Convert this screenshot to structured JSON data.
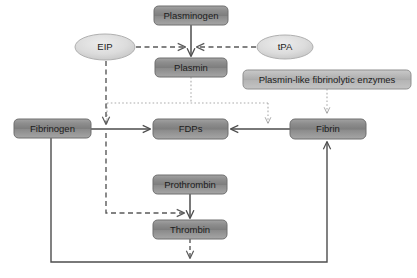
{
  "diagram": {
    "canvas": {
      "width": 417,
      "height": 278,
      "background": "#ffffff"
    },
    "colors": {
      "box_fill_dark": "#8c8c8c",
      "box_fill_light": "#b5b5b5",
      "box_stroke": "#6e6e6e",
      "ellipse_fill": "#d9d9d9",
      "ellipse_stroke": "#9a9a9a",
      "connector_solid": "#4d4d4d",
      "connector_dashed": "#5a5a5a",
      "connector_dotted": "#a8a8a8",
      "text": "#1c1c1c"
    },
    "nodes": [
      {
        "id": "plasminogen",
        "label": "Plasminogen",
        "shape": "rounded-rect",
        "x": 154,
        "y": 6,
        "w": 74,
        "h": 19,
        "fill": "dark",
        "font_size": 9.5
      },
      {
        "id": "eip",
        "label": "EIP",
        "shape": "ellipse",
        "cx": 105,
        "cy": 47,
        "rx": 30,
        "ry": 13,
        "fill": "ellipse",
        "font_size": 9.5
      },
      {
        "id": "tpa",
        "label": "tPA",
        "shape": "ellipse",
        "cx": 285,
        "cy": 47,
        "rx": 28,
        "ry": 12,
        "fill": "ellipse",
        "font_size": 9.5
      },
      {
        "id": "plasmin",
        "label": "Plasmin",
        "shape": "rounded-rect",
        "x": 155,
        "y": 58,
        "w": 72,
        "h": 19,
        "fill": "dark",
        "font_size": 9.5
      },
      {
        "id": "plasmin_like",
        "label": "Plasmin-like fibrinolytic enzymes",
        "shape": "rounded-rect",
        "x": 243,
        "y": 70,
        "w": 168,
        "h": 19,
        "fill": "light",
        "font_size": 9.5
      },
      {
        "id": "fibrinogen",
        "label": "Fibrinogen",
        "shape": "rounded-rect",
        "x": 14,
        "y": 119,
        "w": 77,
        "h": 19,
        "fill": "dark",
        "font_size": 9.5
      },
      {
        "id": "fdps",
        "label": "FDPs",
        "shape": "rounded-rect",
        "x": 153,
        "y": 119,
        "w": 75,
        "h": 20,
        "fill": "dark",
        "font_size": 9.5
      },
      {
        "id": "fibrin",
        "label": "Fibrin",
        "shape": "rounded-rect",
        "x": 290,
        "y": 119,
        "w": 76,
        "h": 20,
        "fill": "dark",
        "font_size": 9.5
      },
      {
        "id": "prothrombin",
        "label": "Prothrombin",
        "shape": "rounded-rect",
        "x": 153,
        "y": 175,
        "w": 74,
        "h": 19,
        "fill": "dark",
        "font_size": 9.5
      },
      {
        "id": "thrombin",
        "label": "Thrombin",
        "shape": "rounded-rect",
        "x": 153,
        "y": 220,
        "w": 74,
        "h": 19,
        "fill": "dark",
        "font_size": 9.5
      }
    ],
    "edges": [
      {
        "id": "plasminogen-to-plasmin",
        "from": "plasminogen",
        "to": "plasmin",
        "style": "solid",
        "arrow": "end"
      },
      {
        "id": "eip-to-activation",
        "from": "eip",
        "to": "plasminogen-plasmin-junction",
        "style": "dashed",
        "arrow": "end"
      },
      {
        "id": "tpa-to-activation",
        "from": "tpa",
        "to": "plasminogen-plasmin-junction",
        "style": "dashed",
        "arrow": "end"
      },
      {
        "id": "plasmin-to-fibrinogen-arrow",
        "from": "plasmin",
        "to": "fibrinogen-fdps-arrow",
        "style": "dotted",
        "arrow": "none"
      },
      {
        "id": "plasmin-to-fibrin-fdps-arrow",
        "from": "plasmin",
        "to": "fibrin-fdps-arrow",
        "style": "dotted",
        "arrow": "end"
      },
      {
        "id": "plasmin-like-to-fibrin",
        "from": "plasmin_like",
        "to": "fibrin",
        "style": "dotted",
        "arrow": "end"
      },
      {
        "id": "fibrinogen-to-fdps",
        "from": "fibrinogen",
        "to": "fdps",
        "style": "solid",
        "arrow": "end"
      },
      {
        "id": "fibrin-to-fdps",
        "from": "fibrin",
        "to": "fdps",
        "style": "solid",
        "arrow": "end"
      },
      {
        "id": "eip-to-fibrinogen-fdps",
        "from": "eip",
        "to": "fibrinogen-fdps-arrow",
        "style": "dashed",
        "arrow": "end"
      },
      {
        "id": "eip-to-thrombin-arrow",
        "from": "eip",
        "to": "prothrombin-thrombin-arrow",
        "style": "dashed",
        "arrow": "end"
      },
      {
        "id": "prothrombin-to-thrombin",
        "from": "prothrombin",
        "to": "thrombin",
        "style": "solid",
        "arrow": "end"
      },
      {
        "id": "thrombin-to-bottom-bus",
        "from": "thrombin",
        "to": "bottom-bus",
        "style": "dashed",
        "arrow": "end"
      },
      {
        "id": "fibrinogen-to-bottom-bus",
        "from": "fibrinogen",
        "to": "bottom-bus",
        "style": "solid",
        "arrow": "none"
      },
      {
        "id": "bottom-bus-to-fibrin",
        "from": "bottom-bus",
        "to": "fibrin",
        "style": "solid",
        "arrow": "end"
      }
    ]
  }
}
